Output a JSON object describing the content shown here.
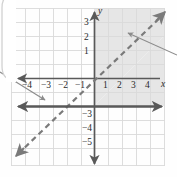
{
  "figure": {
    "kind": "coordinate-plane-graph",
    "background_color": "#fefefe",
    "grid_color": "#d6d6d6",
    "axis_color": "#595959",
    "line_color": "#6b6b6b",
    "shade_color": "#e6e6e6",
    "callout_color": "#8c8c8c"
  },
  "axes": {
    "x_axis_label": "x",
    "y_axis_label": "y",
    "x_tick_labels": [
      "-4",
      "-3",
      "-2",
      "-1",
      "1",
      "2",
      "3",
      "4"
    ],
    "y_tick_labels": [
      "3",
      "2",
      "1",
      "-3",
      "-4",
      "-5"
    ],
    "x_range": [
      -5,
      5
    ],
    "y_range": [
      -6,
      4
    ],
    "origin_px": [
      94,
      78
    ],
    "cell_px": 14
  },
  "chart_data": {
    "type": "line",
    "title": "",
    "xlabel": "x",
    "ylabel": "y",
    "xlim": [
      -5,
      5
    ],
    "ylim": [
      -6,
      4
    ],
    "grid": true,
    "legend": "none",
    "series": [
      {
        "name": "boundary-line-dashed",
        "style": "dashed",
        "slope": 1,
        "intercept": -2,
        "equation": "y = x - 2",
        "arrows": "both",
        "x": [
          -5,
          5
        ],
        "y": [
          -7,
          3
        ]
      },
      {
        "name": "horizontal-line-solid",
        "style": "solid",
        "slope": 0,
        "intercept": -2,
        "equation": "y = -2",
        "arrows": "both",
        "x": [
          -5,
          5
        ],
        "y": [
          -2,
          -2
        ]
      }
    ],
    "shaded_regions": [
      {
        "name": "solution-region",
        "description": "region above the dashed line y = x - 2 and above the solid line y = -2",
        "fill": "#e6e6e6"
      }
    ],
    "annotations": [
      {
        "name": "callout-pointer-left",
        "from": [
          -6.2,
          2.6
        ],
        "to": [
          -3.4,
          -1.4
        ]
      },
      {
        "name": "callout-pointer-right",
        "from": [
          6.4,
          1.6
        ],
        "to": [
          2.9,
          2.4
        ]
      }
    ]
  },
  "x_labels": [
    {
      "text": "-4",
      "left": 22,
      "top": 81
    },
    {
      "text": "-3",
      "left": 41,
      "top": 81
    },
    {
      "text": "-2",
      "left": 58,
      "top": 81
    },
    {
      "text": "-1",
      "left": 75,
      "top": 81
    },
    {
      "text": "1",
      "left": 103,
      "top": 81
    },
    {
      "text": "2",
      "left": 117,
      "top": 81
    },
    {
      "text": "3",
      "left": 131,
      "top": 81
    },
    {
      "text": "4",
      "left": 145,
      "top": 81
    }
  ],
  "y_labels": [
    {
      "text": "3",
      "left": 84,
      "top": 18
    },
    {
      "text": "2",
      "left": 84,
      "top": 33
    },
    {
      "text": "1",
      "left": 84,
      "top": 47
    },
    {
      "text": "-3",
      "left": 82,
      "top": 110
    },
    {
      "text": "-4",
      "left": 82,
      "top": 124
    },
    {
      "text": "-5",
      "left": 82,
      "top": 138
    }
  ],
  "axis_name_labels": [
    {
      "name": "x-axis-name",
      "text": "x",
      "left": 161,
      "top": 80
    },
    {
      "name": "y-axis-name",
      "text": "y",
      "left": 98,
      "top": 7
    }
  ]
}
